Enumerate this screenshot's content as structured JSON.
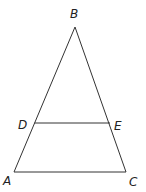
{
  "diagram": {
    "type": "triangle-with-midsegment",
    "points": {
      "A": {
        "label": "A",
        "x": 14,
        "y": 172,
        "lx": 3,
        "ly": 185
      },
      "B": {
        "label": "B",
        "x": 75,
        "y": 27,
        "lx": 70,
        "ly": 18
      },
      "C": {
        "label": "C",
        "x": 126,
        "y": 172,
        "lx": 129,
        "ly": 186
      },
      "D": {
        "label": "D",
        "x": 34.5,
        "y": 123,
        "lx": 18,
        "ly": 129
      },
      "E": {
        "label": "E",
        "x": 110,
        "y": 123,
        "lx": 114,
        "ly": 130
      }
    },
    "segments": [
      {
        "from": "A",
        "to": "B",
        "name": "side-ab"
      },
      {
        "from": "B",
        "to": "C",
        "name": "side-bc"
      },
      {
        "from": "A",
        "to": "C",
        "name": "side-ac"
      },
      {
        "from": "D",
        "to": "E",
        "name": "segment-de"
      }
    ],
    "colors": {
      "stroke": "#333333",
      "text": "#222222",
      "background": "#ffffff"
    }
  }
}
